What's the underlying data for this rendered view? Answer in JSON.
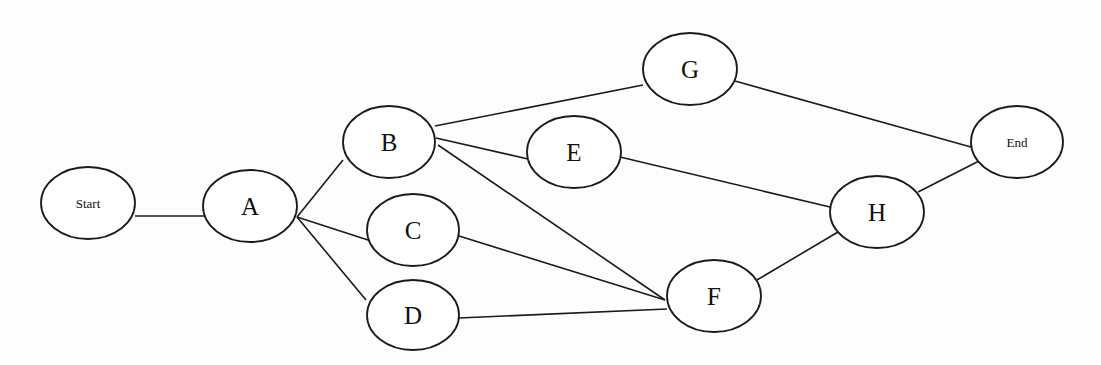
{
  "diagram": {
    "title": "",
    "type": "network-diagram",
    "colors": {
      "stroke": "#1a1a1a",
      "background": "#fdfdfd",
      "node_fill": "#ffffff"
    },
    "nodes": [
      {
        "id": "Start",
        "label": "Start",
        "cx": 88,
        "cy": 203,
        "rx": 47,
        "ry": 36,
        "size": "small"
      },
      {
        "id": "A",
        "label": "A",
        "cx": 250,
        "cy": 206,
        "rx": 47,
        "ry": 36,
        "size": "big"
      },
      {
        "id": "B",
        "label": "B",
        "cx": 389,
        "cy": 142,
        "rx": 46,
        "ry": 36,
        "size": "big"
      },
      {
        "id": "C",
        "label": "C",
        "cx": 413,
        "cy": 230,
        "rx": 46,
        "ry": 36,
        "size": "big"
      },
      {
        "id": "D",
        "label": "D",
        "cx": 413,
        "cy": 315,
        "rx": 46,
        "ry": 35,
        "size": "big"
      },
      {
        "id": "E",
        "label": "E",
        "cx": 574,
        "cy": 152,
        "rx": 47,
        "ry": 36,
        "size": "big"
      },
      {
        "id": "F",
        "label": "F",
        "cx": 714,
        "cy": 296,
        "rx": 47,
        "ry": 36,
        "size": "big"
      },
      {
        "id": "G",
        "label": "G",
        "cx": 690,
        "cy": 69,
        "rx": 47,
        "ry": 36,
        "size": "big"
      },
      {
        "id": "H",
        "label": "H",
        "cx": 877,
        "cy": 212,
        "rx": 47,
        "ry": 36,
        "size": "big"
      },
      {
        "id": "End",
        "label": "End",
        "cx": 1017,
        "cy": 142,
        "rx": 46,
        "ry": 36,
        "size": "small"
      }
    ],
    "edges": [
      {
        "from": "Start",
        "to": "A",
        "x1": 135,
        "y1": 216,
        "x2": 205,
        "y2": 216
      },
      {
        "from": "A",
        "to": "B",
        "x1": 297,
        "y1": 217,
        "x2": 343,
        "y2": 160
      },
      {
        "from": "A",
        "to": "C",
        "x1": 297,
        "y1": 217,
        "x2": 368,
        "y2": 240
      },
      {
        "from": "A",
        "to": "D",
        "x1": 297,
        "y1": 217,
        "x2": 366,
        "y2": 300
      },
      {
        "from": "B",
        "to": "G",
        "x1": 435,
        "y1": 126,
        "x2": 643,
        "y2": 85
      },
      {
        "from": "B",
        "to": "E",
        "x1": 436,
        "y1": 138,
        "x2": 528,
        "y2": 159
      },
      {
        "from": "B",
        "to": "F",
        "x1": 438,
        "y1": 145,
        "x2": 665,
        "y2": 300
      },
      {
        "from": "C",
        "to": "F",
        "x1": 459,
        "y1": 236,
        "x2": 665,
        "y2": 300
      },
      {
        "from": "D",
        "to": "F",
        "x1": 459,
        "y1": 318,
        "x2": 667,
        "y2": 309
      },
      {
        "from": "E",
        "to": "H",
        "x1": 620,
        "y1": 157,
        "x2": 830,
        "y2": 207
      },
      {
        "from": "G",
        "to": "End",
        "x1": 735,
        "y1": 81,
        "x2": 971,
        "y2": 147
      },
      {
        "from": "F",
        "to": "H",
        "x1": 757,
        "y1": 280,
        "x2": 838,
        "y2": 232
      },
      {
        "from": "H",
        "to": "End",
        "x1": 918,
        "y1": 192,
        "x2": 979,
        "y2": 161
      }
    ]
  }
}
